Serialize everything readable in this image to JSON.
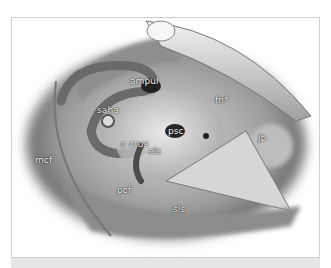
{
  "figure": {
    "labels": [
      {
        "id": "ampul",
        "text": "ampul",
        "x": 130,
        "y": 76
      },
      {
        "id": "saha",
        "text": "saha",
        "x": 97,
        "y": 105
      },
      {
        "id": "psc",
        "text": "psc",
        "x": 168,
        "y": 126
      },
      {
        "id": "fn",
        "text": "fn*",
        "x": 215,
        "y": 95
      },
      {
        "id": "jb",
        "text": "jb",
        "x": 258,
        "y": 133
      },
      {
        "id": "c-crus",
        "text": "c crus",
        "x": 121,
        "y": 139
      },
      {
        "id": "els",
        "text": "els",
        "x": 148,
        "y": 146
      },
      {
        "id": "mcf",
        "text": "mcf",
        "x": 35,
        "y": 155
      },
      {
        "id": "pcf",
        "text": "pcf",
        "x": 117,
        "y": 185
      },
      {
        "id": "sls",
        "text": "sls",
        "x": 173,
        "y": 204
      }
    ]
  }
}
